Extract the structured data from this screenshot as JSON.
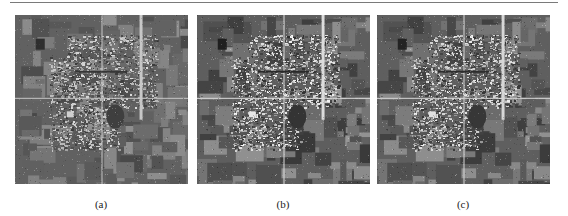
{
  "figure": {
    "panels": [
      {
        "id": "a",
        "caption": "(a)",
        "x": 15,
        "width": 173,
        "seed": 11,
        "contrast": 0.85
      },
      {
        "id": "b",
        "caption": "(b)",
        "x": 197,
        "width": 173,
        "seed": 23,
        "contrast": 1.05
      },
      {
        "id": "c",
        "caption": "(c)",
        "x": 377,
        "width": 173,
        "seed": 23,
        "contrast": 1.0
      }
    ]
  }
}
